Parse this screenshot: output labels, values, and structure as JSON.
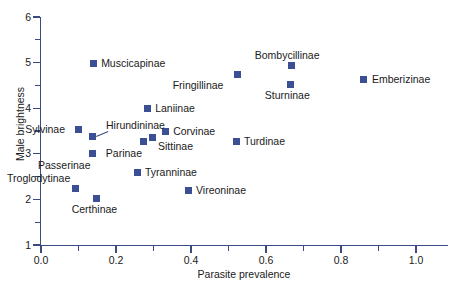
{
  "chart_data": {
    "type": "scatter",
    "title": "",
    "xlabel": "Parasite prevalence",
    "ylabel": "Male brightness",
    "xlim": [
      0.0,
      1.0
    ],
    "ylim": [
      1,
      6
    ],
    "grid": false,
    "legend": "none",
    "x_ticks": [
      "0.0",
      "0.2",
      "0.4",
      "0.6",
      "0.8",
      "1.0"
    ],
    "x_tick_values": [
      0.0,
      0.2,
      0.4,
      0.6,
      0.8,
      1.0
    ],
    "x_minor_tick_values": [
      0.1,
      0.3,
      0.5,
      0.7,
      0.9
    ],
    "y_ticks": [
      "1",
      "2",
      "3",
      "4",
      "5",
      "6"
    ],
    "y_tick_values": [
      1,
      2,
      3,
      4,
      5,
      6
    ],
    "y_minor_tick_values": [
      1.5,
      2.5,
      3.5,
      4.5,
      5.5
    ],
    "marker_color": "#3a4f94",
    "axis_color": "#3b4a82",
    "points": [
      {
        "label": "Muscicapinae",
        "x": 0.139,
        "y": 4.97,
        "label_side": "right"
      },
      {
        "label": "Bombycillinae",
        "x": 0.667,
        "y": 4.93,
        "label_side": "above"
      },
      {
        "label": "Emberizinae",
        "x": 0.861,
        "y": 4.64,
        "label_side": "right"
      },
      {
        "label": "Fringillinae",
        "x": 0.525,
        "y": 4.75,
        "label_side": "below-left"
      },
      {
        "label": "Sturninae",
        "x": 0.664,
        "y": 4.53,
        "label_side": "below"
      },
      {
        "label": "Laniinae",
        "x": 0.283,
        "y": 4.0,
        "label_side": "right"
      },
      {
        "label": "Corvinae",
        "x": 0.331,
        "y": 3.5,
        "label_side": "right"
      },
      {
        "label": "Sylvinae",
        "x": 0.099,
        "y": 3.54,
        "label_side": "left"
      },
      {
        "label": "Hirundininae",
        "x": 0.136,
        "y": 3.37,
        "label_side": "leader-above-right"
      },
      {
        "label": "Sittinae",
        "x": 0.296,
        "y": 3.35,
        "label_side": "below-right"
      },
      {
        "label": "Parinae",
        "x": 0.272,
        "y": 3.26,
        "label_side": "below-left"
      },
      {
        "label": "Turdinae",
        "x": 0.52,
        "y": 3.28,
        "label_side": "right"
      },
      {
        "label": "Passerinae",
        "x": 0.136,
        "y": 3.0,
        "label_side": "below-left"
      },
      {
        "label": "Tyranninae",
        "x": 0.256,
        "y": 2.6,
        "label_side": "right"
      },
      {
        "label": "Troglodytinae",
        "x": 0.093,
        "y": 2.25,
        "label_side": "above-left"
      },
      {
        "label": "Vireoninae",
        "x": 0.392,
        "y": 2.2,
        "label_side": "right"
      },
      {
        "label": "Certhinae",
        "x": 0.149,
        "y": 2.03,
        "label_side": "below"
      }
    ]
  }
}
